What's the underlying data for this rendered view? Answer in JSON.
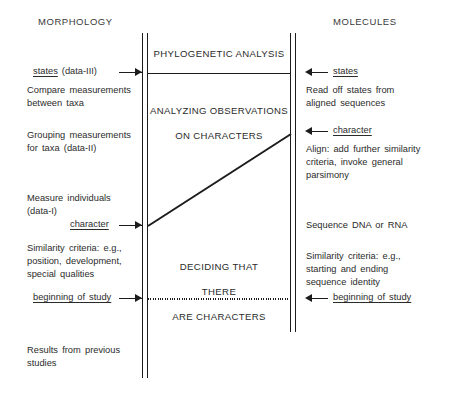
{
  "diagram": {
    "title_left": "MORPHOLOGY",
    "title_right": "MOLECULES",
    "center_stages": [
      "PHYLOGENETIC ANALYSIS",
      "ANALYZING OBSERVATIONS",
      "ON CHARACTERS",
      "DECIDING THAT",
      "THERE",
      "ARE CHARACTERS"
    ],
    "left_column": {
      "markers": [
        {
          "label": "states",
          "suffix": " (data-III)",
          "arrow": "arrow-right-states-left"
        },
        {
          "label": "character",
          "suffix": "",
          "arrow": "arrow-right-character-left"
        },
        {
          "label": "beginning of study",
          "suffix": "",
          "arrow": "arrow-right-beginning-left"
        }
      ],
      "notes": [
        "Compare measurements\nbetween taxa",
        "Grouping measurements\nfor taxa (data-II)",
        "Measure individuals\n(data-I)",
        "Similarity criteria: e.g.,\nposition, development,\nspecial qualities",
        "Results from previous\nstudies"
      ]
    },
    "right_column": {
      "markers": [
        {
          "label": "states",
          "arrow": "arrow-left-states-right"
        },
        {
          "label": "character",
          "arrow": "arrow-left-character-right"
        },
        {
          "label": "beginning of study",
          "arrow": "arrow-left-beginning-right"
        }
      ],
      "notes": [
        "Read off states from\naligned sequences",
        "Align: add further similarity\ncriteria, invoke general\nparsimony",
        "Sequence DNA or RNA",
        "Similarity criteria: e.g.,\nstarting and ending\nsequence identity"
      ]
    },
    "colors": {
      "ink": "#1c1c1c",
      "text": "#2b2b2b",
      "background": "#ffffff"
    }
  }
}
